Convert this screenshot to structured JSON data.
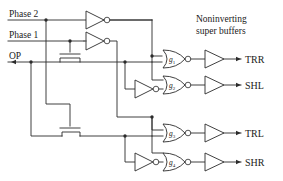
{
  "diagram": {
    "kind": "logic-circuit-schematic",
    "colors": {
      "background": "#ffffff",
      "wire": "#2b2b2b",
      "text": "#1a1a1a"
    },
    "inputs": [
      {
        "id": "phase2",
        "label": "Phase 2"
      },
      {
        "id": "phase1",
        "label": "Phase 1"
      },
      {
        "id": "op",
        "label": "OP"
      }
    ],
    "annotation": {
      "line1": "Noninverting",
      "line2": "super buffers"
    },
    "nor_gates": [
      {
        "id": "g1",
        "label": "g",
        "subscript": "1"
      },
      {
        "id": "g2",
        "label": "g",
        "subscript": "2"
      },
      {
        "id": "g3",
        "label": "g",
        "subscript": "3"
      },
      {
        "id": "g4",
        "label": "g",
        "subscript": "4"
      }
    ],
    "outputs": [
      {
        "id": "trr",
        "label": "TRR"
      },
      {
        "id": "shl",
        "label": "SHL"
      },
      {
        "id": "trl",
        "label": "TRL"
      },
      {
        "id": "shr",
        "label": "SHR"
      }
    ],
    "inverters": [
      {
        "id": "inv-phase2",
        "name": "inverter-phase2"
      },
      {
        "id": "inv-phase1",
        "name": "inverter-phase1"
      },
      {
        "id": "inv-g2",
        "name": "inverter-g2-input"
      },
      {
        "id": "inv-g4",
        "name": "inverter-g4-input"
      }
    ],
    "buffers": [
      {
        "id": "buf-trr",
        "name": "super-buffer-trr"
      },
      {
        "id": "buf-shl",
        "name": "super-buffer-shl"
      },
      {
        "id": "buf-trl",
        "name": "super-buffer-trl"
      },
      {
        "id": "buf-shr",
        "name": "super-buffer-shr"
      }
    ],
    "pass_transistors": [
      {
        "id": "pass-top",
        "name": "pass-transistor-top"
      },
      {
        "id": "pass-bottom",
        "name": "pass-transistor-bottom"
      }
    ]
  }
}
